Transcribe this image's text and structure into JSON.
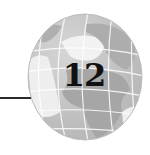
{
  "chapter": {
    "number": "12"
  },
  "globe": {
    "icon": "globe-icon",
    "colors": {
      "ocean": "#c4c4c4",
      "land": "#a9a9a9",
      "highlight": "#f2f2f2",
      "grid": "#ffffff"
    }
  },
  "rule": {
    "color": "#2a2a2a"
  }
}
